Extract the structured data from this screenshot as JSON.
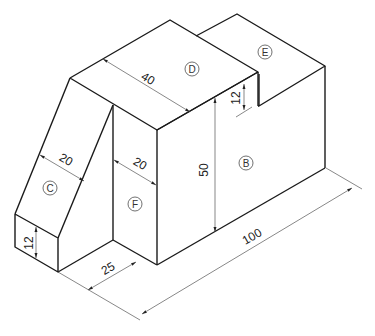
{
  "colors": {
    "edge": "#1a1a1a",
    "dimension": "#555555",
    "background": "#ffffff"
  },
  "dimensions": {
    "top_depth": "40",
    "step_height": "12",
    "height": "50",
    "slope_width": "20",
    "f_width": "20",
    "base_height": "12",
    "base_length": "25",
    "total_length": "100"
  },
  "faces": {
    "B": "B",
    "C": "C",
    "D": "D",
    "E": "E",
    "F": "F"
  }
}
